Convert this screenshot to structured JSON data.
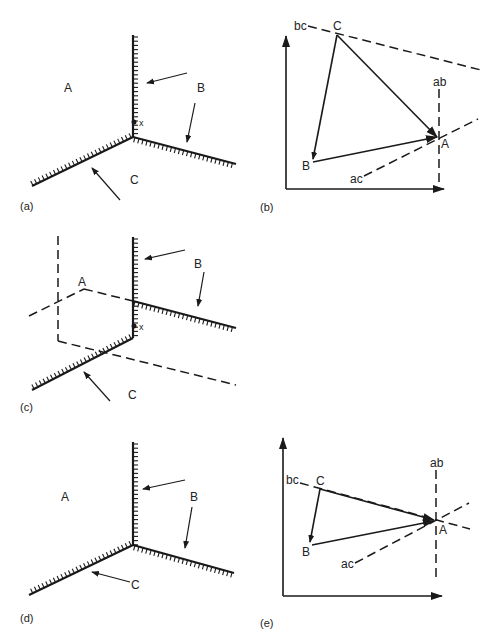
{
  "figure": {
    "panels": [
      {
        "id": "a",
        "label": "(a)",
        "type": "grain-boundary-junction",
        "phase_labels": {
          "A": "A",
          "B": "B",
          "C": "C"
        },
        "point_label": "x",
        "arrows": 3
      },
      {
        "id": "b",
        "label": "(b)",
        "type": "vector-diagram",
        "vertex_labels": {
          "A": "A",
          "B": "B",
          "C": "C"
        },
        "line_labels": {
          "bc": "bc",
          "ab": "ab",
          "ac": "ac"
        }
      },
      {
        "id": "c",
        "label": "(c)",
        "type": "grain-boundary-junction-with-construction",
        "phase_labels": {
          "A": "A",
          "B": "B",
          "C": "C"
        },
        "point_label": "x"
      },
      {
        "id": "d",
        "label": "(d)",
        "type": "grain-boundary-junction",
        "phase_labels": {
          "A": "A",
          "B": "B",
          "C": "C"
        }
      },
      {
        "id": "e",
        "label": "(e)",
        "type": "vector-diagram",
        "vertex_labels": {
          "A": "A",
          "B": "B",
          "C": "C"
        },
        "line_labels": {
          "bc": "bc",
          "ab": "ab",
          "ac": "ac"
        }
      }
    ]
  },
  "labels": {
    "a": {
      "panel": "(a)",
      "A": "A",
      "B": "B",
      "C": "C",
      "x": "x"
    },
    "b": {
      "panel": "(b)",
      "A": "A",
      "B": "B",
      "C": "C",
      "bc": "bc",
      "ab": "ab",
      "ac": "ac"
    },
    "c": {
      "panel": "(c)",
      "A": "A",
      "B": "B",
      "C": "C",
      "x": "x"
    },
    "d": {
      "panel": "(d)",
      "A": "A",
      "B": "B",
      "C": "C"
    },
    "e": {
      "panel": "(e)",
      "A": "A",
      "B": "B",
      "C": "C",
      "bc": "bc",
      "ab": "ab",
      "ac": "ac"
    }
  },
  "colors": {
    "ink": "#1a1a1a",
    "background": "#ffffff"
  }
}
